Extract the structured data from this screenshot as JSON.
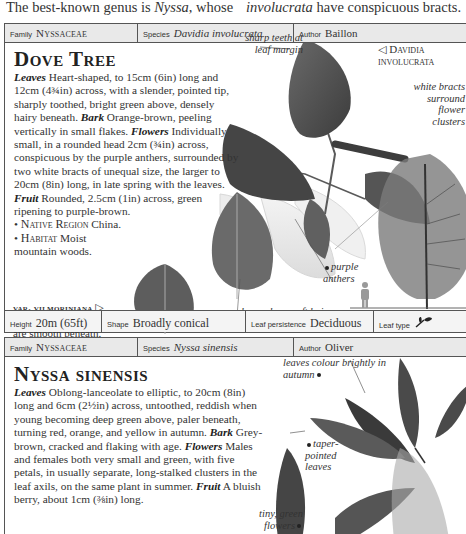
{
  "intro": {
    "left_prefix": "The best-known genus is ",
    "left_italic": "Nyssa",
    "left_suffix": ", whose",
    "right_italic": "involucrata",
    "right_suffix": " have conspicuous bracts."
  },
  "entries": [
    {
      "header": {
        "family_label": "Family",
        "family_value": "Nyssaceae",
        "species_label": "Species",
        "species_value": "Davidia involucrata",
        "author_label": "Author",
        "author_value": "Baillon"
      },
      "title": "Dove Tree",
      "description": {
        "leaves_label": "Leaves",
        "leaves_text": " Heart-shaped, to 15cm (6in) long and 12cm (4¾in) across, with a slender, pointed tip, sharply toothed, bright green above, densely hairy beneath. ",
        "bark_label": "Bark",
        "bark_text": " Orange-brown, peeling vertically in small flakes. ",
        "flowers_label": "Flowers",
        "flowers_text": " Individually small, in a rounded head 2cm (¾in) across, conspicuous by the purple anthers, surrounded by two white bracts of unequal size, the larger to 20cm (8in) long, in late spring with the leaves. ",
        "fruit_label": "Fruit",
        "fruit_text": " Rounded, 2.5cm (1in) across, green ripening to purple-brown.",
        "native_region_label": "Native Region",
        "native_region_value": " China.",
        "habitat_label": "Habitat",
        "habitat_value": " Moist mountain woods."
      },
      "annotations": {
        "sharp_teeth": "sharp teeth at leaf margin",
        "main_caption": "Davidia involucrata",
        "white_bracts": "white bracts surround flower clusters",
        "purple_anthers": "purple anthers",
        "soft_hairs": "leaves have soft hairs on underside"
      },
      "variety": {
        "name": "var. vilmoriniana",
        "text": "The leaves of this variety are smooth beneath."
      },
      "footer": {
        "height_label": "Height",
        "height_value": "20m (65ft)",
        "shape_label": "Shape",
        "shape_value": "Broadly conical",
        "persistence_label": "Leaf persistence",
        "persistence_value": "Deciduous",
        "leaf_type_label": "Leaf type",
        "leaf_type_icon": "simple-leaf-icon"
      }
    },
    {
      "header": {
        "family_label": "Family",
        "family_value": "Nyssaceae",
        "species_label": "Species",
        "species_value": "Nyssa sinensis",
        "author_label": "Author",
        "author_value": "Oliver"
      },
      "title": "Nyssa sinensis",
      "description": {
        "leaves_label": "Leaves",
        "leaves_text": " Oblong-lanceolate to elliptic, to 20cm (8in) long and 6cm (2½in) across, untoothed, reddish when young becoming deep green above, paler beneath, turning red, orange, and yellow in autumn. ",
        "bark_label": "Bark",
        "bark_text": " Grey-brown, cracked and flaking with age. ",
        "flowers_label": "Flowers",
        "flowers_text": " Males and females both very small and green, with five petals, in usually separate, long-stalked clusters in the leaf axils, on the same plant in summer. ",
        "fruit_label": "Fruit",
        "fruit_text": " A bluish berry, about 1cm (⅜in) long."
      },
      "annotations": {
        "autumn_colour": "leaves colour brightly in autumn",
        "taper_pointed": "taper-pointed leaves",
        "tiny_flowers": "tiny, green flowers"
      }
    }
  ],
  "colors": {
    "header_bg": "#e9e9e9",
    "border": "#555555",
    "leaf_dark": "#4a4a4a",
    "text": "#333333"
  }
}
